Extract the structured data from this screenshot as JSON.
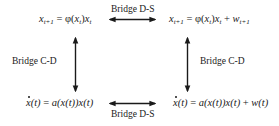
{
  "diagram": {
    "nodes": {
      "top_left": {
        "id": "discrete-deterministic",
        "lhs_var": "x",
        "lhs_sub": "t+1",
        "eq": "=",
        "phi": "φ",
        "arg_var": "x",
        "arg_sub": "t",
        "rhs_var": "x",
        "rhs_sub": "t"
      },
      "top_right": {
        "id": "discrete-stochastic",
        "lhs_var": "x",
        "lhs_sub": "t+1",
        "eq": "=",
        "phi": "φ",
        "arg_var": "x",
        "arg_sub": "t",
        "rhs_var": "x",
        "rhs_sub": "t",
        "plus": "+",
        "noise_var": "w",
        "noise_sub": "t+1"
      },
      "bottom_left": {
        "id": "continuous-deterministic",
        "lhs": "x",
        "lhs_arg": "(t)",
        "eq": "=",
        "fn": "a",
        "rhs": "(x(t))x(t)"
      },
      "bottom_right": {
        "id": "continuous-stochastic",
        "lhs": "x",
        "lhs_arg": "(t)",
        "eq": "=",
        "fn": "a",
        "rhs": "(x(t))x(t)",
        "plus": "+",
        "noise": "w(t)"
      }
    },
    "edges": {
      "top": {
        "label": "Bridge D-S",
        "from": "top_left",
        "to": "top_right",
        "direction": "bidirectional"
      },
      "bottom": {
        "label": "Bridge D-S",
        "from": "bottom_left",
        "to": "bottom_right",
        "direction": "bidirectional"
      },
      "left": {
        "label": "Bridge C-D",
        "from": "top_left",
        "to": "bottom_left",
        "direction": "bidirectional"
      },
      "right": {
        "label": "Bridge C-D",
        "from": "top_right",
        "to": "bottom_right",
        "direction": "bidirectional"
      }
    },
    "colors": {
      "stroke": "#1a1a1a",
      "text": "#1a1a1a",
      "background": "#ffffff"
    }
  }
}
